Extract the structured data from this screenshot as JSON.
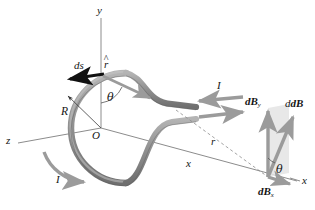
{
  "figure": {
    "background_color": "#ffffff",
    "ring_color": "#9a9a9a",
    "ring_edge_color": "#5d5d5d",
    "axis_color": "#8c8c8c",
    "arrow_gray": "#9b9b9b",
    "arrow_dark": "#111111",
    "shade_color": "#e2e2e2",
    "text_color": "#141414"
  },
  "axes": {
    "y": {
      "label": "y",
      "x": 97,
      "y": 8
    },
    "x": {
      "label": "x",
      "x": 300,
      "y": 180
    },
    "z": {
      "label": "z",
      "x": 8,
      "y": 140
    },
    "origin": {
      "label": "O",
      "x": 96,
      "y": 128
    }
  },
  "loop": {
    "radius_label": {
      "label": "R",
      "x": 62,
      "y": 114
    },
    "current_label_lead": {
      "label": "I",
      "x": 216,
      "y": 85
    },
    "current_label_loop": {
      "label": "I",
      "x": 57,
      "y": 178
    },
    "ds_label": {
      "label": "ds",
      "x": 78,
      "y": 64
    },
    "rhat_label": {
      "label": "r",
      "accent": "^",
      "x": 108,
      "y": 62
    },
    "theta_loop": {
      "label": "θ",
      "x": 110,
      "y": 95
    }
  },
  "field_point": {
    "r_label": {
      "label": "r",
      "x": 210,
      "y": 143
    },
    "x_distance_label": {
      "label": "x",
      "x": 187,
      "y": 165
    }
  },
  "vectors": {
    "dB": {
      "label": "dB",
      "x": 283,
      "y": 105
    },
    "dBy": {
      "label": "dB",
      "sub": "y",
      "x": 247,
      "y": 103
    },
    "dBx": {
      "label": "dB",
      "sub": "x",
      "x": 262,
      "y": 192
    },
    "theta_field": {
      "label": "θ",
      "x": 278,
      "y": 172
    }
  },
  "icon_names": {
    "ds_arrow": "ds-vector-arrow",
    "rhat_arrow": "r-hat-unit-vector-arrow",
    "current_arrow_in": "current-arrow-inbound",
    "current_arrow_out": "current-arrow-outbound",
    "loop_current_arrow": "loop-current-curved-arrow",
    "dB_arrow": "dB-vector-arrow",
    "dBy_arrow": "dBy-component-arrow",
    "dBx_arrow": "dBx-component-arrow"
  }
}
